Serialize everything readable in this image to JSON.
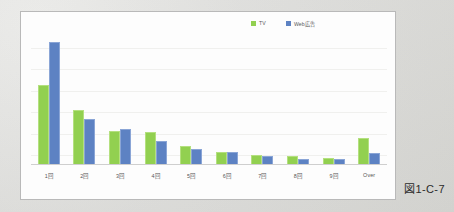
{
  "figure": {
    "caption": "図1-C-7"
  },
  "legend": {
    "position": "top-right",
    "entries": [
      {
        "label": "TV",
        "color": "#92d050",
        "icon": "square-marker-icon"
      },
      {
        "label": "Web広告",
        "color": "#5d82c3",
        "icon": "square-marker-icon"
      }
    ]
  },
  "chart_data": {
    "type": "bar",
    "title": "",
    "subtitle": "",
    "xlabel": "",
    "ylabel": "",
    "grid": true,
    "legend_position": "top-right",
    "categories": [
      "1回",
      "2回",
      "3回",
      "4回",
      "5回",
      "6回",
      "7回",
      "8回",
      "9回",
      "Over"
    ],
    "ylim": [
      0,
      100
    ],
    "series": [
      {
        "name": "TV",
        "color": "#92d050",
        "values": [
          52,
          36,
          22,
          21,
          12,
          8,
          6,
          5,
          4,
          17
        ]
      },
      {
        "name": "Web広告",
        "color": "#5d82c3",
        "values": [
          81,
          30,
          23,
          15,
          10,
          8,
          5,
          3,
          3,
          7
        ]
      }
    ]
  }
}
